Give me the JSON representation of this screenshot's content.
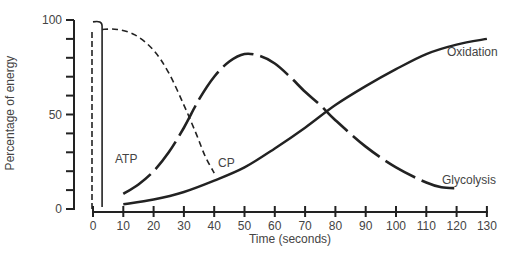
{
  "chart_data": {
    "type": "line",
    "title": "",
    "xlabel": "Time (seconds)",
    "ylabel": "Percentage of energy",
    "xlim": [
      0,
      130
    ],
    "ylim": [
      0,
      100
    ],
    "grid": false,
    "legend_position": "inline labels",
    "x_ticks": [
      0,
      10,
      20,
      30,
      40,
      50,
      60,
      70,
      80,
      90,
      100,
      110,
      120,
      130
    ],
    "y_ticks": [
      0,
      50,
      100
    ],
    "y_minor_ticks": [
      10,
      20,
      30,
      40,
      60,
      70,
      80,
      90
    ],
    "series": [
      {
        "name": "ATP",
        "style": "dashed-vertical",
        "points": [
          [
            0,
            0
          ],
          [
            0,
            95
          ]
        ],
        "note": "dashed vertical line at t≈0 from 0 to ~95%"
      },
      {
        "name": "ATP (solid)",
        "style": "solid-vertical",
        "points": [
          [
            3,
            1
          ],
          [
            3,
            100
          ],
          [
            1.5,
            100
          ],
          [
            0,
            99
          ]
        ],
        "note": "solid vertical line at t≈3 rising to ~100% with curl at top"
      },
      {
        "name": "CP",
        "style": "short-dash",
        "points": [
          [
            3,
            95
          ],
          [
            8,
            95
          ],
          [
            14,
            92
          ],
          [
            20,
            84
          ],
          [
            25,
            72
          ],
          [
            30,
            55
          ],
          [
            34,
            40
          ],
          [
            37,
            28
          ],
          [
            40,
            19
          ]
        ]
      },
      {
        "name": "Glycolysis",
        "style": "long-dash",
        "points": [
          [
            10,
            8
          ],
          [
            15,
            13
          ],
          [
            20,
            20
          ],
          [
            25,
            30
          ],
          [
            30,
            43
          ],
          [
            35,
            58
          ],
          [
            40,
            70
          ],
          [
            45,
            78
          ],
          [
            50,
            82
          ],
          [
            55,
            81
          ],
          [
            60,
            77
          ],
          [
            65,
            70
          ],
          [
            70,
            62
          ],
          [
            75,
            55
          ],
          [
            80,
            47
          ],
          [
            90,
            33
          ],
          [
            100,
            22
          ],
          [
            110,
            14
          ],
          [
            115,
            11.5
          ],
          [
            120,
            11
          ]
        ]
      },
      {
        "name": "Oxidation",
        "style": "solid",
        "points": [
          [
            10,
            2.5
          ],
          [
            20,
            5
          ],
          [
            30,
            9
          ],
          [
            40,
            15
          ],
          [
            50,
            22
          ],
          [
            60,
            32
          ],
          [
            70,
            43
          ],
          [
            80,
            55
          ],
          [
            90,
            65
          ],
          [
            100,
            74
          ],
          [
            110,
            82
          ],
          [
            120,
            87
          ],
          [
            130,
            90
          ]
        ]
      }
    ],
    "annotations": [
      {
        "text": "ATP",
        "x": 14,
        "y": 27
      },
      {
        "text": "CP",
        "x": 42,
        "y": 23
      },
      {
        "text": "Glycolysis",
        "x": 117,
        "y": 16
      },
      {
        "text": "Oxidation",
        "x": 117,
        "y": 81
      }
    ]
  },
  "labels": {
    "ylabel": "Percentage of energy",
    "xlabel": "Time (seconds)",
    "y_tick_0": "0",
    "y_tick_50": "50",
    "y_tick_100": "100",
    "atp": "ATP",
    "cp": "CP",
    "glycolysis": "Glycolysis",
    "oxidation": "Oxidation"
  }
}
